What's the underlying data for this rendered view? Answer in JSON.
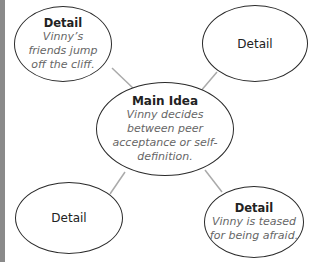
{
  "diagram": {
    "main": {
      "title": "Main Idea",
      "text": "Vinny decides between peer acceptance or self-definition."
    },
    "details": [
      {
        "title": "Detail",
        "text": "Vinny’s friends jump off the cliff."
      },
      {
        "title": "Detail",
        "text": ""
      },
      {
        "title": "Detail",
        "text": ""
      },
      {
        "title": "Detail",
        "text": "Vinny is teased for being afraid."
      }
    ]
  }
}
